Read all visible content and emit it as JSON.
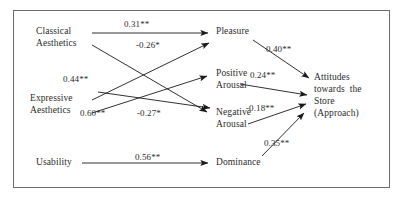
{
  "figure": {
    "type": "path-diagram",
    "border_color": "#6d6d6d",
    "line_color": "#1a1a1a",
    "text_color": "#2b2b2b",
    "background": "#ffffff"
  },
  "nodes": {
    "classical_aesthetics": {
      "line1": "Classical",
      "line2": "Aesthetics"
    },
    "expressive_aesthetics": {
      "line1": "Expressive",
      "line2": "Aesthetics"
    },
    "usability": {
      "line1": "Usability"
    },
    "pleasure": {
      "line1": "Pleasure"
    },
    "positive_arousal": {
      "line1": "Positive",
      "line2": "Arousal"
    },
    "negative_arousal": {
      "line1": "Negative",
      "line2": "Arousal"
    },
    "dominance": {
      "line1": "Dominance"
    },
    "attitudes": {
      "line1": "Attitudes",
      "line2": "towards  the",
      "line3": "Store",
      "line4": "(Approach)"
    }
  },
  "paths": [
    {
      "id": "classical-to-pleasure",
      "from": "Classical Aesthetics",
      "to": "Pleasure",
      "coefficient": "0.31",
      "stars": "**"
    },
    {
      "id": "classical-to-negative",
      "from": "Classical Aesthetics",
      "to": "Negative Arousal",
      "coefficient": "-0.26",
      "stars": "*"
    },
    {
      "id": "expressive-to-pleasure",
      "from": "Expressive Aesthetics",
      "to": "Pleasure",
      "coefficient": "0.44",
      "stars": "**"
    },
    {
      "id": "expressive-to-positive",
      "from": "Expressive Aesthetics",
      "to": "Positive Arousal",
      "coefficient": "0.60",
      "stars": "**"
    },
    {
      "id": "expressive-to-negative",
      "from": "Expressive Aesthetics",
      "to": "Negative Arousal",
      "coefficient": "-0.27",
      "stars": "*"
    },
    {
      "id": "usability-to-dominance",
      "from": "Usability",
      "to": "Dominance",
      "coefficient": "0.56",
      "stars": "**"
    },
    {
      "id": "pleasure-to-attitudes",
      "from": "Pleasure",
      "to": "Attitudes",
      "coefficient": "0.40",
      "stars": "**"
    },
    {
      "id": "positive-to-attitudes",
      "from": "Positive Arousal",
      "to": "Attitudes",
      "coefficient": "0.24",
      "stars": "**"
    },
    {
      "id": "negative-to-attitudes",
      "from": "Negative Arousal",
      "to": "Attitudes",
      "coefficient": "-0.18",
      "stars": "**"
    },
    {
      "id": "dominance-to-attitudes",
      "from": "Dominance",
      "to": "Attitudes",
      "coefficient": "0.35",
      "stars": "**"
    }
  ],
  "coef_text": {
    "classical_pleasure": "0.31**",
    "classical_negative": "-0.26*",
    "expressive_pleasure": "0.44**",
    "expressive_positive": "0.60**",
    "expressive_negative": "-0.27*",
    "usability_dominance": "0.56**",
    "pleasure_attitudes": "0.40**",
    "positive_attitudes": "0.24**",
    "negative_attitudes": "-0.18**",
    "dominance_attitudes": "0.35**"
  }
}
